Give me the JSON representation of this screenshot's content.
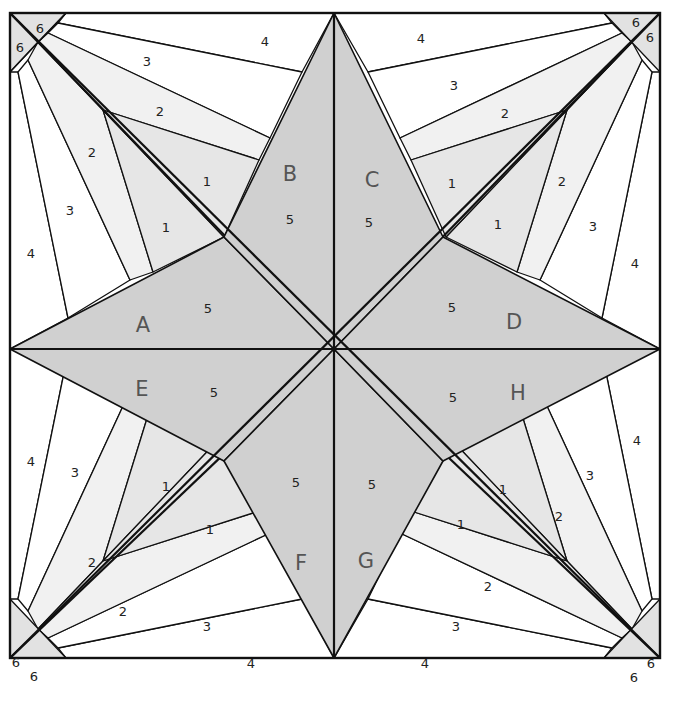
{
  "diagram": {
    "type": "quilt-block-paper-piecing-pattern",
    "colors": {
      "star": "#d0d0d0",
      "piece_1": "#e6e6e6",
      "piece_2": "#f1f1f1",
      "piece_3": "#ffffff",
      "piece_4": "#ffffff",
      "piece_6": "#e2e2e2",
      "line": "#111111",
      "letter": "#555555"
    },
    "sections": [
      {
        "id": "A",
        "label": "A",
        "x": 143,
        "y": 325,
        "star_number": "5",
        "star_number_pos": [
          208,
          308
        ]
      },
      {
        "id": "B",
        "label": "B",
        "x": 290,
        "y": 174,
        "star_number": "5",
        "star_number_pos": [
          290,
          219
        ]
      },
      {
        "id": "C",
        "label": "C",
        "x": 372,
        "y": 180,
        "star_number": "5",
        "star_number_pos": [
          369,
          222
        ]
      },
      {
        "id": "D",
        "label": "D",
        "x": 514,
        "y": 322,
        "star_number": "5",
        "star_number_pos": [
          452,
          307
        ]
      },
      {
        "id": "E",
        "label": "E",
        "x": 142,
        "y": 389,
        "star_number": "5",
        "star_number_pos": [
          214,
          392
        ]
      },
      {
        "id": "F",
        "label": "F",
        "x": 301,
        "y": 563,
        "star_number": "5",
        "star_number_pos": [
          296,
          482
        ]
      },
      {
        "id": "G",
        "label": "G",
        "x": 366,
        "y": 561,
        "star_number": "5",
        "star_number_pos": [
          372,
          484
        ]
      },
      {
        "id": "H",
        "label": "H",
        "x": 518,
        "y": 393,
        "star_number": "5",
        "star_number_pos": [
          453,
          397
        ]
      }
    ],
    "piece_numbers": [
      {
        "text": "6",
        "x": 40,
        "y": 28
      },
      {
        "text": "6",
        "x": 20,
        "y": 47
      },
      {
        "text": "4",
        "x": 265,
        "y": 41
      },
      {
        "text": "3",
        "x": 147,
        "y": 61
      },
      {
        "text": "2",
        "x": 160,
        "y": 111
      },
      {
        "text": "2",
        "x": 92,
        "y": 152
      },
      {
        "text": "1",
        "x": 207,
        "y": 181
      },
      {
        "text": "1",
        "x": 166,
        "y": 227
      },
      {
        "text": "3",
        "x": 70,
        "y": 210
      },
      {
        "text": "4",
        "x": 31,
        "y": 253
      },
      {
        "text": "6",
        "x": 636,
        "y": 22
      },
      {
        "text": "6",
        "x": 650,
        "y": 37
      },
      {
        "text": "4",
        "x": 421,
        "y": 38
      },
      {
        "text": "3",
        "x": 454,
        "y": 85
      },
      {
        "text": "2",
        "x": 505,
        "y": 113
      },
      {
        "text": "2",
        "x": 562,
        "y": 181
      },
      {
        "text": "1",
        "x": 452,
        "y": 183
      },
      {
        "text": "1",
        "x": 498,
        "y": 224
      },
      {
        "text": "3",
        "x": 593,
        "y": 226
      },
      {
        "text": "4",
        "x": 635,
        "y": 263
      },
      {
        "text": "6",
        "x": 16,
        "y": 662
      },
      {
        "text": "6",
        "x": 34,
        "y": 676
      },
      {
        "text": "4",
        "x": 31,
        "y": 461
      },
      {
        "text": "3",
        "x": 75,
        "y": 472
      },
      {
        "text": "1",
        "x": 166,
        "y": 486
      },
      {
        "text": "1",
        "x": 210,
        "y": 529
      },
      {
        "text": "2",
        "x": 92,
        "y": 562
      },
      {
        "text": "2",
        "x": 123,
        "y": 611
      },
      {
        "text": "3",
        "x": 207,
        "y": 626
      },
      {
        "text": "4",
        "x": 251,
        "y": 663
      },
      {
        "text": "6",
        "x": 651,
        "y": 663
      },
      {
        "text": "6",
        "x": 634,
        "y": 677
      },
      {
        "text": "4",
        "x": 637,
        "y": 440
      },
      {
        "text": "3",
        "x": 590,
        "y": 475
      },
      {
        "text": "1",
        "x": 503,
        "y": 489
      },
      {
        "text": "1",
        "x": 461,
        "y": 524
      },
      {
        "text": "2",
        "x": 559,
        "y": 516
      },
      {
        "text": "2",
        "x": 488,
        "y": 586
      },
      {
        "text": "3",
        "x": 456,
        "y": 626
      },
      {
        "text": "4",
        "x": 425,
        "y": 663
      }
    ]
  }
}
